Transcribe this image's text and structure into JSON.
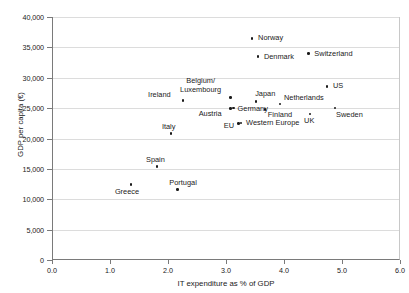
{
  "chart_data": {
    "type": "scatter",
    "title": "",
    "xlabel": "IT expenditure as % of GDP",
    "ylabel": "GDP per capita (€)",
    "xlim": [
      0.0,
      6.0
    ],
    "ylim": [
      0,
      40000
    ],
    "xticks": [
      "0.0",
      "1.0",
      "2.0",
      "3.0",
      "4.0",
      "5.0",
      "6.0"
    ],
    "xtick_values": [
      0.0,
      1.0,
      2.0,
      3.0,
      4.0,
      5.0,
      6.0
    ],
    "yticks": [
      "0",
      "5,000",
      "10,000",
      "15,000",
      "20,000",
      "25,000",
      "30,000",
      "35,000",
      "40,000"
    ],
    "ytick_values": [
      0,
      5000,
      10000,
      15000,
      20000,
      25000,
      30000,
      35000,
      40000
    ],
    "grid": "horizontal",
    "legend": "none",
    "marker_color": "#1a1a1a",
    "gridline_color": "#dcdcdc",
    "axis_color": "#7a7a7a",
    "points": [
      {
        "label": "Norway",
        "x": 3.45,
        "y": 36500,
        "lx": 6,
        "ly": -4,
        "multiline": false
      },
      {
        "label": "Denmark",
        "x": 3.55,
        "y": 33450,
        "lx": 6,
        "ly": -4,
        "multiline": false
      },
      {
        "label": "Switzerland",
        "x": 4.42,
        "y": 33950,
        "lx": 6,
        "ly": -4,
        "multiline": false
      },
      {
        "label": "US",
        "x": 4.74,
        "y": 28600,
        "lx": 6,
        "ly": -4,
        "multiline": false
      },
      {
        "label": "Ireland",
        "x": 2.26,
        "y": 26250,
        "lx": -35,
        "ly": -10,
        "multiline": false
      },
      {
        "label": "Belgium/ Luxembourg",
        "x": 3.08,
        "y": 26750,
        "lx": -59,
        "ly": -20,
        "multiline": true
      },
      {
        "label": "Japan",
        "x": 3.52,
        "y": 26050,
        "lx": -1,
        "ly": -12,
        "multiline": false
      },
      {
        "label": "Netherlands",
        "x": 3.93,
        "y": 25650,
        "lx": 4,
        "ly": -10,
        "multiline": false
      },
      {
        "label": "Germany",
        "x": 3.13,
        "y": 25000,
        "lx": 4,
        "ly": -3,
        "multiline": false
      },
      {
        "label": "Austria",
        "x": 3.08,
        "y": 24950,
        "lx": -32,
        "ly": 2,
        "multiline": false
      },
      {
        "label": "Finland",
        "x": 3.67,
        "y": 24750,
        "lx": 3,
        "ly": 1,
        "multiline": false
      },
      {
        "label": "Sweden",
        "x": 4.88,
        "y": 25050,
        "lx": 1,
        "ly": 3,
        "multiline": false
      },
      {
        "label": "UK",
        "x": 4.45,
        "y": 24050,
        "lx": -6,
        "ly": 3,
        "multiline": false
      },
      {
        "label": "EU",
        "x": 3.22,
        "y": 22500,
        "lx": -15,
        "ly": -1,
        "multiline": false
      },
      {
        "label": "Western Europe",
        "x": 3.26,
        "y": 22550,
        "lx": 5,
        "ly": -4,
        "multiline": false
      },
      {
        "label": "Italy",
        "x": 2.05,
        "y": 20800,
        "lx": -9,
        "ly": -11,
        "multiline": false
      },
      {
        "label": "Spain",
        "x": 1.81,
        "y": 15350,
        "lx": -11,
        "ly": -11,
        "multiline": false
      },
      {
        "label": "Portugal",
        "x": 2.16,
        "y": 11600,
        "lx": -8,
        "ly": -11,
        "multiline": false
      },
      {
        "label": "Greece",
        "x": 1.36,
        "y": 12400,
        "lx": -16,
        "ly": 3,
        "multiline": false
      }
    ]
  }
}
